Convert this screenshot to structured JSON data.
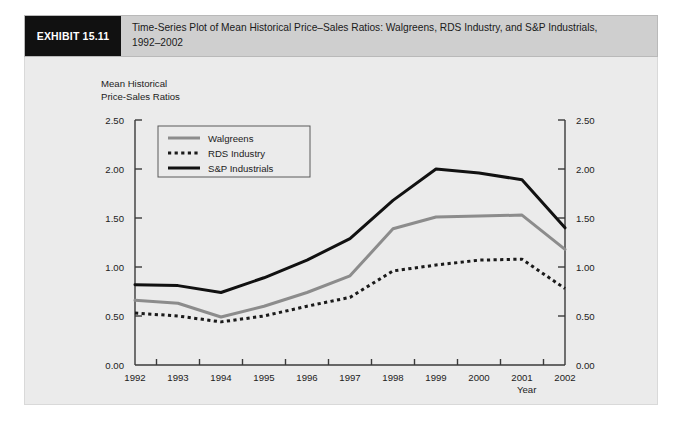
{
  "exhibit": {
    "tag": "EXHIBIT 15.11",
    "title_line1": "Time-Series Plot of Mean Historical Price–Sales Ratios: Walgreens, RDS Industry, and S&P Industrials,",
    "title_line2": "1992–2002"
  },
  "axis_caption": {
    "line1": "Mean Historical",
    "line2": "Price-Sales Ratios"
  },
  "year_caption": "Year",
  "colors": {
    "panel_background": "#ebebeb",
    "header_background": "#cfcfcf",
    "tag_background": "#111111",
    "walgreens": "#8c8c8c",
    "rds_industry": "#1a1a1a",
    "sp_industrials": "#111111",
    "axis": "#3a3a3a"
  },
  "chart_data": {
    "type": "line",
    "xlabel": "Year",
    "ylabel": "Mean Historical Price-Sales Ratios",
    "x": [
      1992,
      1993,
      1994,
      1995,
      1996,
      1997,
      1998,
      1999,
      2000,
      2001,
      2002
    ],
    "categories": [
      "1992",
      "1993",
      "1994",
      "1995",
      "1996",
      "1997",
      "1998",
      "1999",
      "2000",
      "2001",
      "2002"
    ],
    "xlim": [
      1992,
      2002
    ],
    "ylim": [
      0.0,
      2.5
    ],
    "yticks": [
      0.0,
      0.5,
      1.0,
      1.5,
      2.0,
      2.5
    ],
    "ytick_labels": [
      "0.00",
      "0.50",
      "1.00",
      "1.50",
      "2.00",
      "2.50"
    ],
    "grid": false,
    "legend_position": "top-left inside",
    "dual_y_axis": true,
    "series": [
      {
        "name": "Walgreens",
        "style": "solid",
        "color": "#8c8c8c",
        "width": 3,
        "values": [
          0.66,
          0.63,
          0.49,
          0.6,
          0.74,
          0.91,
          1.39,
          1.51,
          1.52,
          1.53,
          1.18
        ]
      },
      {
        "name": "RDS Industry",
        "style": "dotted",
        "color": "#1a1a1a",
        "width": 3,
        "values": [
          0.53,
          0.5,
          0.44,
          0.5,
          0.6,
          0.69,
          0.96,
          1.02,
          1.07,
          1.08,
          0.78
        ]
      },
      {
        "name": "S&P Industrials",
        "style": "solid",
        "color": "#111111",
        "width": 3,
        "values": [
          0.82,
          0.81,
          0.74,
          0.89,
          1.07,
          1.29,
          1.68,
          2.0,
          1.96,
          1.89,
          1.4
        ]
      }
    ]
  }
}
